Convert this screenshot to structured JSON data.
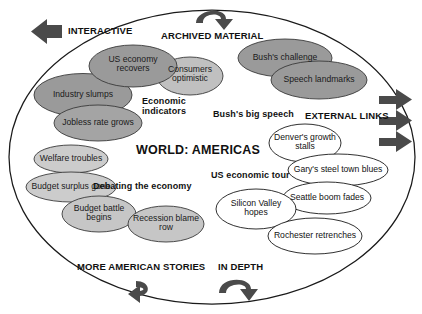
{
  "diagram": {
    "title": "WORLD: AMERICAS",
    "center_label": "WORLD: AMERICAS",
    "shape": "large-ellipse-canvas",
    "colors": {
      "bubble_dark_grey": "#9a9a9a",
      "bubble_mid_grey": "#a8a8a8",
      "bubble_light_grey": "#c9c9c9",
      "bubble_white": "#ffffff",
      "outline": "#1a1a1a",
      "arrow": "#4a4a4a",
      "text": "#111111",
      "background": "#ffffff"
    }
  },
  "sections": {
    "interactive": "INTERACTIVE",
    "archived_material": "ARCHIVED MATERIAL",
    "external_links": "EXTERNAL LINKS",
    "more_american_stories": "MORE AMERICAN STORIES",
    "in_depth": "IN DEPTH"
  },
  "topics": {
    "economic_indicators": "Economic indicators",
    "bushs_big_speech": "Bush's big speech",
    "debating_the_economy": "Debating the economy",
    "us_economic_tour": "US economic tour"
  },
  "clusters": [
    {
      "name": "economic-indicators",
      "topic": "Economic indicators",
      "style": "grey",
      "bubbles": [
        {
          "label": "US economy recovers",
          "fill": "#9a9a9a"
        },
        {
          "label": "Consumers optimistic",
          "fill": "#c0c0c0"
        },
        {
          "label": "Industry slumps",
          "fill": "#9a9a9a"
        },
        {
          "label": "Jobless rate grows",
          "fill": "#a4a4a4"
        }
      ]
    },
    {
      "name": "bushs-big-speech",
      "topic": "Bush's big speech",
      "style": "grey",
      "bubbles": [
        {
          "label": "Bush's challenge",
          "fill": "#9a9a9a"
        },
        {
          "label": "Speech landmarks",
          "fill": "#9a9a9a"
        }
      ]
    },
    {
      "name": "debating-the-economy",
      "topic": "Debating the economy",
      "style": "light-grey",
      "bubbles": [
        {
          "label": "Welfare troubles",
          "fill": "#cccccc"
        },
        {
          "label": "Budget surplus gone",
          "fill": "#cccccc"
        },
        {
          "label": "Budget battle begins",
          "fill": "#c6c6c6"
        },
        {
          "label": "Recession blame row",
          "fill": "#c6c6c6"
        }
      ]
    },
    {
      "name": "us-economic-tour",
      "topic": "US economic tour",
      "style": "white",
      "bubbles": [
        {
          "label": "Denver's growth stalls",
          "fill": "#ffffff"
        },
        {
          "label": "Gary's steel town blues",
          "fill": "#ffffff"
        },
        {
          "label": "Seattle boom fades",
          "fill": "#ffffff"
        },
        {
          "label": "Silicon Valley hopes",
          "fill": "#ffffff"
        },
        {
          "label": "Rochester retrenches",
          "fill": "#ffffff"
        }
      ]
    }
  ],
  "bubbles": {
    "us_economy_recovers": "US economy recovers",
    "consumers_optimistic": "Consumers optimistic",
    "industry_slumps": "Industry slumps",
    "jobless_rate_grows": "Jobless rate grows",
    "bushs_challenge": "Bush's challenge",
    "speech_landmarks": "Speech landmarks",
    "welfare_troubles": "Welfare troubles",
    "budget_surplus_gone": "Budget surplus gone",
    "budget_battle_begins": "Budget battle begins",
    "recession_blame_row": "Recession blame row",
    "denvers_growth_stalls": "Denver's growth stalls",
    "garys_steel_town_blues": "Gary's steel town blues",
    "seattle_boom_fades": "Seattle boom fades",
    "silicon_valley_hopes": "Silicon Valley hopes",
    "rochester_retrenches": "Rochester retrenches"
  },
  "arrows": {
    "interactive_arrow": "arrow-left",
    "archived_arrow": "curved-arrow-clockwise",
    "external_link_1": "arrow-right",
    "external_link_2": "arrow-right",
    "external_link_3": "arrow-right",
    "more_stories_arrow": "curved-arrow-left",
    "in_depth_arrow": "curved-arrow-down"
  }
}
